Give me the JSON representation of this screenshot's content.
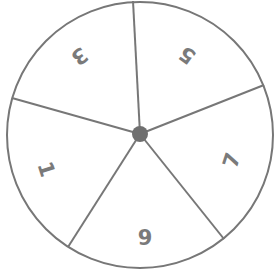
{
  "spinner": {
    "center": [
      140,
      134
    ],
    "radius": 133,
    "line_color": "#777777",
    "hub_color": "#6f6f6f",
    "sections": [
      {
        "label": "9",
        "rotation": 0
      },
      {
        "label": "1",
        "rotation": 72
      },
      {
        "label": "3",
        "rotation": 144
      },
      {
        "label": "5",
        "rotation": 216
      },
      {
        "label": "7",
        "rotation": 288
      }
    ]
  }
}
